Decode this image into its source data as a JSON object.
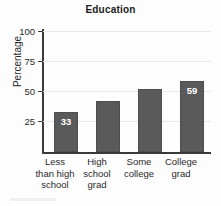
{
  "chart_data": {
    "type": "bar",
    "title": "Education",
    "xlabel": "",
    "ylabel": "Percentage",
    "categories": [
      "Less than high school",
      "High school grad",
      "Some college",
      "College grad"
    ],
    "category_lines": [
      [
        "Less",
        "than high",
        "school"
      ],
      [
        "High",
        "school",
        "grad"
      ],
      [
        "Some",
        "college",
        ""
      ],
      [
        "College",
        "grad",
        ""
      ]
    ],
    "values": [
      33,
      42,
      52,
      59
    ],
    "value_labels": [
      "33",
      "",
      "",
      "59"
    ],
    "ylim": [
      0,
      100
    ],
    "yticks": [
      25,
      50,
      75,
      100
    ],
    "ytick_labels": [
      "25",
      "50",
      "75",
      "100"
    ],
    "grid": true,
    "legend": "none",
    "bar_color": "#5a5a5a",
    "value_label_color": "#ffffff",
    "axis_color": "#3a3a3a",
    "gridline_color": "#e9e9e9",
    "background_color": "#fdfdfd"
  }
}
